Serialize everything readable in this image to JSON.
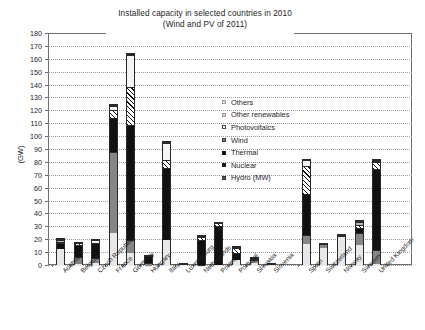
{
  "chart_data": {
    "type": "bar",
    "stacked": true,
    "title": "Installed capacity in selected countries in 2010",
    "subtitle": "(Wind and PV of 2011)",
    "xlabel": "",
    "ylabel": "(GW)",
    "ylim": [
      0,
      180
    ],
    "ytick_step": 10,
    "yticks": [
      "180",
      "170",
      "160",
      "150",
      "140",
      "130",
      "120",
      "110",
      "100",
      "90",
      "80",
      "70",
      "60",
      "50",
      "40",
      "30",
      "20",
      "10",
      "0"
    ],
    "grid": true,
    "legend_position": "inside-center",
    "categories": [
      "Austria",
      "Belgium",
      "Czech Republic",
      "France",
      "Germany",
      "Hungary",
      "Italy",
      "Luxembourg",
      "Netherlands",
      "Poland",
      "Portugal",
      "Slovakia",
      "Slovenia",
      "Spain",
      "Switzerland",
      "Norway",
      "Sweden",
      "United Kingdom"
    ],
    "series": [
      {
        "name": "Hydro (MW)",
        "values": [
          13.0,
          1.4,
          2.2,
          25.3,
          10.3,
          0.1,
          20.5,
          1.1,
          0.1,
          0.9,
          4.6,
          2.5,
          1.1,
          16.7,
          13.6,
          23.2,
          16.2,
          1.7
        ]
      },
      {
        "name": "Nuclear",
        "values": [
          0.0,
          5.9,
          3.9,
          63.1,
          10.0,
          1.9,
          0.0,
          0.0,
          0.5,
          0.0,
          0.0,
          1.8,
          0.0,
          7.5,
          3.2,
          0.0,
          9.4,
          11.0
        ]
      },
      {
        "name": "Thermal",
        "values": [
          4.8,
          9.2,
          11.9,
          26.2,
          89.4,
          5.5,
          55.4,
          0.2,
          19.5,
          30.5,
          5.2,
          1.5,
          0.2,
          31.6,
          0.0,
          0.3,
          3.6,
          62.3
        ]
      },
      {
        "name": "Wind",
        "values": [
          1.0,
          1.1,
          0.2,
          6.8,
          29.1,
          0.3,
          6.7,
          0.0,
          2.3,
          1.6,
          3.8,
          0.0,
          0.0,
          21.7,
          0.1,
          0.5,
          2.9,
          6.0
        ]
      },
      {
        "name": "Photovoltaics",
        "values": [
          0.2,
          0.2,
          1.9,
          2.9,
          24.8,
          0.0,
          12.8,
          0.0,
          0.1,
          0.0,
          0.2,
          0.0,
          0.0,
          4.4,
          0.2,
          0.0,
          0.0,
          0.8
        ]
      },
      {
        "name": "Other renewables",
        "values": [
          1.4,
          0.3,
          0.2,
          0.6,
          0.4,
          0.0,
          0.3,
          0.1,
          0.3,
          0.2,
          0.8,
          0.2,
          0.1,
          0.4,
          0.1,
          0.1,
          2.0,
          0.3
        ]
      },
      {
        "name": "Others",
        "values": [
          0.2,
          0.1,
          0.1,
          0.3,
          0.2,
          0.0,
          0.2,
          0.0,
          0.2,
          0.1,
          0.2,
          0.1,
          0.0,
          0.2,
          0.1,
          0.0,
          0.9,
          0.2
        ]
      }
    ],
    "totals": [
      20.6,
      18.2,
      20.4,
      125.2,
      164.2,
      7.8,
      95.9,
      1.4,
      23.0,
      33.3,
      14.8,
      6.1,
      1.4,
      82.5,
      17.3,
      24.1,
      35.0,
      82.3
    ]
  },
  "legend": {
    "items": [
      {
        "label": "Others",
        "key": "k-others"
      },
      {
        "label": "Other renewables",
        "key": "k-orenew"
      },
      {
        "label": "Photovoltaics",
        "key": "k-pv"
      },
      {
        "label": "Wind",
        "key": "k-wind"
      },
      {
        "label": "Thermal",
        "key": "k-thermal"
      },
      {
        "label": "Nuclear",
        "key": "k-nuclear"
      },
      {
        "label": "Hydro (MW)",
        "key": "k-hydro"
      }
    ]
  }
}
